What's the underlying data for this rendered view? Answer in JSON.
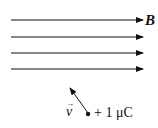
{
  "diagram": {
    "field_label": "B",
    "field_lines_count": 4,
    "velocity_label": "v",
    "velocity_arrow": "→",
    "charge_label": "+ 1 μC",
    "colors": {
      "ink": "#111111",
      "background": "#ffffff"
    }
  }
}
